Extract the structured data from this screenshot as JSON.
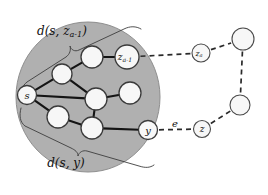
{
  "figure": {
    "type": "graph-diagram",
    "background_color": "#ffffff",
    "region": {
      "name": "settled-region-ellipse",
      "fill_color": "#b0b0b0",
      "stroke_color": "#8c8c8c",
      "cx": 88,
      "cy": 97,
      "rx": 72,
      "ry": 75
    },
    "colors": {
      "node_fill": "#f7f7f7",
      "node_stroke": "#3a3a3a",
      "tree_edge": "#141414",
      "dashed_edge": "#2a2a2a",
      "brace": "#3d3d3d",
      "text": "#111111"
    }
  },
  "nodes": [
    {
      "id": "s",
      "name": "node-s",
      "label": "s",
      "sub": "",
      "cx": 27,
      "cy": 95,
      "r": 9.5,
      "inside": true,
      "labeled": true
    },
    {
      "id": "n1",
      "name": "node-inner-1",
      "label": "",
      "sub": "",
      "cx": 62,
      "cy": 74,
      "r": 10,
      "inside": true,
      "labeled": false
    },
    {
      "id": "n2",
      "name": "node-inner-2",
      "label": "",
      "sub": "",
      "cx": 92,
      "cy": 57,
      "r": 11,
      "inside": true,
      "labeled": false
    },
    {
      "id": "za1",
      "name": "node-z-a-minus-1",
      "label": "z",
      "sub": "a-1",
      "cx": 127,
      "cy": 57,
      "r": 12,
      "inside": true,
      "labeled": true
    },
    {
      "id": "n3",
      "name": "node-inner-3",
      "label": "",
      "sub": "",
      "cx": 96,
      "cy": 99,
      "r": 11,
      "inside": true,
      "labeled": false
    },
    {
      "id": "n4",
      "name": "node-inner-4",
      "label": "",
      "sub": "",
      "cx": 130,
      "cy": 93,
      "r": 11,
      "inside": true,
      "labeled": false
    },
    {
      "id": "n5",
      "name": "node-inner-5",
      "label": "",
      "sub": "",
      "cx": 58,
      "cy": 117,
      "r": 11,
      "inside": true,
      "labeled": false
    },
    {
      "id": "n6",
      "name": "node-inner-6",
      "label": "",
      "sub": "",
      "cx": 92,
      "cy": 128,
      "r": 11,
      "inside": true,
      "labeled": false
    },
    {
      "id": "y",
      "name": "node-y",
      "label": "y",
      "sub": "",
      "cx": 148,
      "cy": 130,
      "r": 9.5,
      "inside": true,
      "labeled": true
    },
    {
      "id": "za",
      "name": "node-z-a",
      "label": "z",
      "sub": "a",
      "cx": 201,
      "cy": 53,
      "r": 9,
      "inside": false,
      "labeled": true
    },
    {
      "id": "z",
      "name": "node-z",
      "label": "z",
      "sub": "",
      "cx": 202,
      "cy": 129,
      "r": 8.5,
      "inside": false,
      "labeled": true
    },
    {
      "id": "tr",
      "name": "node-outer-top-right",
      "label": "",
      "sub": "",
      "cx": 243,
      "cy": 39,
      "r": 11,
      "inside": false,
      "labeled": false
    },
    {
      "id": "mr",
      "name": "node-outer-mid-right",
      "label": "",
      "sub": "",
      "cx": 240,
      "cy": 105,
      "r": 10,
      "inside": false,
      "labeled": false
    }
  ],
  "tree_edges": [
    {
      "name": "edge-s-n1",
      "from": "s",
      "to": "n1"
    },
    {
      "name": "edge-n1-n2",
      "from": "n1",
      "to": "n2"
    },
    {
      "name": "edge-n2-za1",
      "from": "n2",
      "to": "za1"
    },
    {
      "name": "edge-s-n3",
      "from": "s",
      "to": "n3"
    },
    {
      "name": "edge-n1-n3",
      "from": "n1",
      "to": "n3"
    },
    {
      "name": "edge-n3-n4",
      "from": "n3",
      "to": "n4"
    },
    {
      "name": "edge-s-n5",
      "from": "s",
      "to": "n5"
    },
    {
      "name": "edge-n5-n6",
      "from": "n5",
      "to": "n6"
    },
    {
      "name": "edge-n3-n6",
      "from": "n3",
      "to": "n6"
    },
    {
      "name": "edge-n6-y",
      "from": "n6",
      "to": "y"
    }
  ],
  "dashed_edges": [
    {
      "name": "dashed-edge-za1-za",
      "from": "za1",
      "to": "za"
    },
    {
      "name": "dashed-edge-za-tr",
      "from": "za",
      "to": "tr"
    },
    {
      "name": "dashed-edge-tr-mr",
      "from": "tr",
      "to": "mr"
    },
    {
      "name": "dashed-edge-mr-z",
      "from": "mr",
      "to": "z"
    },
    {
      "name": "dashed-edge-y-z",
      "from": "y",
      "to": "z"
    }
  ],
  "edge_labels": [
    {
      "name": "edge-label-e",
      "text": "e",
      "x": 175,
      "y": 123
    }
  ],
  "braces": [
    {
      "name": "brace-top",
      "label_main": "d(s,",
      "label_var": "z",
      "label_sub": "a-1",
      "label_close": ")",
      "label_x": 62,
      "label_y": 31
    },
    {
      "name": "brace-bottom",
      "label_main": "d(s, y)",
      "label_x": 66,
      "label_y": 163
    }
  ]
}
